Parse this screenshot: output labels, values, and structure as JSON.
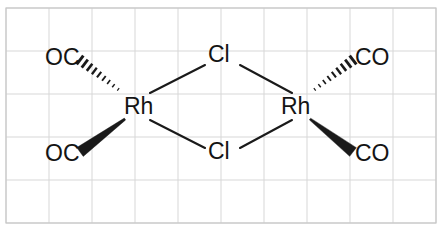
{
  "figure": {
    "kind": "chemical-structure-diagram",
    "background_color": "#ffffff",
    "grid_color": "#d7d7d7",
    "bond_color": "#1a1a1a",
    "label_color": "#141414"
  },
  "grid": {
    "origin_x": 6,
    "origin_y": 8,
    "cell_width": 43,
    "cell_height": 43,
    "columns": 10,
    "rows": 5,
    "line_color": "#d7d7d7",
    "border_color": "#c8c8c8"
  },
  "atoms": [
    {
      "id": "oc-top-left",
      "text": "OC",
      "x": 45,
      "y": 46
    },
    {
      "id": "oc-bottom-left",
      "text": "OC",
      "x": 45,
      "y": 142
    },
    {
      "id": "rh-left",
      "text": "Rh",
      "x": 124,
      "y": 95
    },
    {
      "id": "cl-top",
      "text": "Cl",
      "x": 208,
      "y": 43
    },
    {
      "id": "cl-bottom",
      "text": "Cl",
      "x": 208,
      "y": 140
    },
    {
      "id": "rh-right",
      "text": "Rh",
      "x": 281,
      "y": 95
    },
    {
      "id": "co-top-right",
      "text": "CO",
      "x": 355,
      "y": 46
    },
    {
      "id": "co-bottom-right",
      "text": "CO",
      "x": 355,
      "y": 142
    }
  ],
  "bonds": [
    {
      "id": "bond-rh-left-cl-top",
      "type": "plain",
      "x1": 150,
      "y1": 93,
      "x2": 205,
      "y2": 65
    },
    {
      "id": "bond-cl-top-rh-right",
      "type": "plain",
      "x1": 240,
      "y1": 65,
      "x2": 292,
      "y2": 93
    },
    {
      "id": "bond-rh-left-cl-bottom",
      "type": "plain",
      "x1": 150,
      "y1": 120,
      "x2": 205,
      "y2": 148
    },
    {
      "id": "bond-cl-bottom-rh-right",
      "type": "plain",
      "x1": 240,
      "y1": 148,
      "x2": 292,
      "y2": 120
    }
  ],
  "stereo_bonds": [
    {
      "id": "hash-wedge-oc-top-left",
      "type": "hashed",
      "label_ref": "oc-top-left",
      "narrow_x": 123,
      "narrow_y": 93,
      "wide_x": 80,
      "wide_y": 60,
      "hash_count": 9
    },
    {
      "id": "solid-wedge-oc-bottom-left",
      "type": "solid",
      "label_ref": "oc-bottom-left",
      "narrow_x": 125,
      "narrow_y": 119,
      "wide_x": 80,
      "wide_y": 152,
      "hash_count": 0
    },
    {
      "id": "hash-wedge-co-top-right",
      "type": "hashed",
      "label_ref": "co-top-right",
      "narrow_x": 310,
      "narrow_y": 93,
      "wide_x": 353,
      "wide_y": 60,
      "hash_count": 9
    },
    {
      "id": "solid-wedge-co-bottom-right",
      "type": "solid",
      "label_ref": "co-bottom-right",
      "narrow_x": 310,
      "narrow_y": 119,
      "wide_x": 353,
      "wide_y": 152,
      "hash_count": 0
    }
  ]
}
